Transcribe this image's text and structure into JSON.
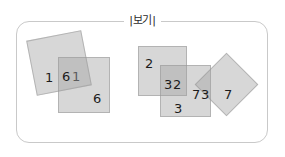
{
  "figure": {
    "caption": "보기",
    "caption_left_bar": "|",
    "caption_right_bar": "|",
    "frame_border_color": "#c9c9c9",
    "shape_fill_color": "#a0a0a0",
    "shape_stroke_color": "#969696",
    "number_color": "#1c1c1c"
  },
  "groups": [
    {
      "id": "left-group",
      "name": "left-overlapping-squares",
      "shapes": [
        {
          "id": "left-tilted-square",
          "kind": "square",
          "rotation_deg": -11,
          "labels": [
            "1",
            "1"
          ]
        },
        {
          "id": "left-upright-square",
          "kind": "square",
          "rotation_deg": 0,
          "labels": [
            "6",
            "6"
          ]
        }
      ]
    },
    {
      "id": "right-group",
      "name": "right-overlapping-squares",
      "shapes": [
        {
          "id": "right-square-two",
          "kind": "square",
          "rotation_deg": 0,
          "labels": [
            "2",
            "2"
          ]
        },
        {
          "id": "right-square-three",
          "kind": "square",
          "rotation_deg": 0,
          "labels": [
            "3",
            "3"
          ]
        },
        {
          "id": "right-diamond-seven",
          "kind": "square-rotated-45",
          "rotation_deg": 45,
          "labels": [
            "7",
            "7"
          ]
        }
      ]
    }
  ],
  "labels": {
    "left_tilted_a": "1",
    "left_tilted_b": "1",
    "left_upright_a": "6",
    "left_upright_b": "6",
    "right_two_a": "2",
    "right_two_b": "2",
    "right_three_a": "3",
    "right_three_b": "3",
    "right_seven_a": "7",
    "right_seven_b": "7"
  }
}
